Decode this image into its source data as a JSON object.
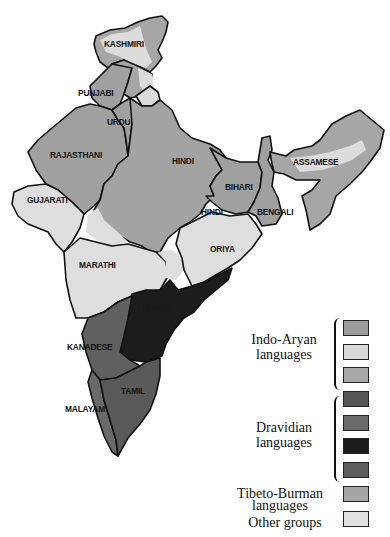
{
  "map": {
    "title": "Languages of India",
    "colors": {
      "indo_aryan_1": "#9b9b9b",
      "indo_aryan_2": "#d9d9d9",
      "indo_aryan_3": "#a8a8a8",
      "dravidian_1": "#555555",
      "dravidian_2": "#6a6a6a",
      "dravidian_3": "#1c1c1c",
      "dravidian_4": "#5e5e5e",
      "tibeto_burman": "#a5a5a5",
      "other": "#e2e2e2"
    },
    "labels": {
      "kashmiri": "KASHMIRI",
      "punjabi": "PUNJABI",
      "urdu": "URDU",
      "rajasthani": "RAJASTHANI",
      "hindi_north": "HINDI",
      "hindi_south": "HINDI",
      "bihari": "BIHARI",
      "bengali": "BENGALI",
      "assamese": "ASSAMESE",
      "gujarati": "GUJARATI",
      "marathi": "MARATHI",
      "oriya": "ORIYA",
      "telugu": "TELUGU",
      "kanadese": "KANADESE",
      "tamil": "TAMIL",
      "malayam": "MALAYAM"
    }
  },
  "legend": {
    "groups": [
      {
        "label_line1": "Indo-Aryan",
        "label_line2": "languages",
        "swatches": [
          "#9b9b9b",
          "#d9d9d9",
          "#a8a8a8"
        ]
      },
      {
        "label_line1": "Dravidian",
        "label_line2": "languages",
        "swatches": [
          "#555555",
          "#6a6a6a",
          "#1c1c1c",
          "#5e5e5e"
        ]
      },
      {
        "label_line1": "Tibeto-Burman",
        "label_line2": "languages",
        "swatches": [
          "#a5a5a5"
        ]
      },
      {
        "label_line1": "Other groups",
        "label_line2": "",
        "swatches": [
          "#e2e2e2"
        ]
      }
    ]
  }
}
